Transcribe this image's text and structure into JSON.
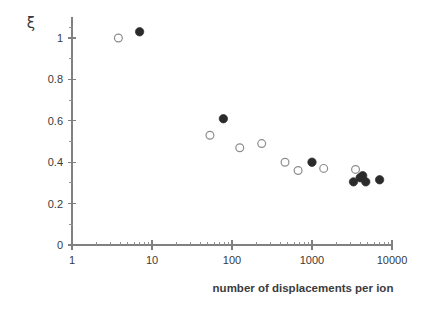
{
  "figure": {
    "width": 427,
    "height": 309,
    "background": "#ffffff"
  },
  "chart_data": {
    "type": "scatter",
    "title": "",
    "xlabel": "number of displacements per ion",
    "ylabel": "ξ",
    "xscale": "log",
    "yscale": "linear",
    "xlim": [
      1,
      10000
    ],
    "ylim": [
      0,
      1.1
    ],
    "grid": false,
    "legend": "none",
    "x_ticks": [
      1,
      10,
      100,
      1000,
      10000
    ],
    "x_tick_labels": [
      "1",
      "10",
      "100",
      "1000",
      "10000"
    ],
    "y_ticks": [
      0,
      0.2,
      0.4,
      0.6,
      0.8,
      1
    ],
    "y_tick_labels": [
      "0",
      "0.2",
      "0.4",
      "0.6",
      "0.8",
      "1"
    ],
    "y_minor_ticks": [
      0.1,
      0.3,
      0.5,
      0.7,
      0.9,
      1.05
    ],
    "marker_colors": {
      "filled": "#2b2b2b",
      "open_edge": "#8c8c8c",
      "open_fill": "#ffffff"
    },
    "series": [
      {
        "name": "open-circles",
        "marker": "open-circle",
        "points": [
          {
            "x": 3.8,
            "y": 1.0
          },
          {
            "x": 53,
            "y": 0.53
          },
          {
            "x": 125,
            "y": 0.47
          },
          {
            "x": 235,
            "y": 0.49
          },
          {
            "x": 460,
            "y": 0.4
          },
          {
            "x": 670,
            "y": 0.36
          },
          {
            "x": 1400,
            "y": 0.37
          },
          {
            "x": 3500,
            "y": 0.365
          }
        ]
      },
      {
        "name": "filled-circles",
        "marker": "filled-circle",
        "points": [
          {
            "x": 7.0,
            "y": 1.03
          },
          {
            "x": 78,
            "y": 0.61
          },
          {
            "x": 1000,
            "y": 0.4
          },
          {
            "x": 3300,
            "y": 0.305
          },
          {
            "x": 4000,
            "y": 0.325
          },
          {
            "x": 4300,
            "y": 0.335
          },
          {
            "x": 4700,
            "y": 0.305
          },
          {
            "x": 7000,
            "y": 0.315
          }
        ]
      }
    ]
  }
}
